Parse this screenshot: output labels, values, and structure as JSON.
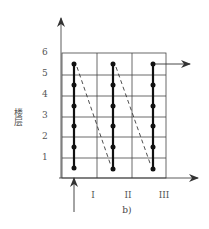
{
  "diagram": {
    "caption": "b)",
    "y_axis_label": "楼层",
    "y_ticks": [
      "1",
      "2",
      "3",
      "4",
      "5",
      "6"
    ],
    "x_sections": [
      "I",
      "II",
      "III"
    ],
    "grid": {
      "columns": 3,
      "rows": 6
    },
    "flow_columns": [
      {
        "section": "I",
        "floors_visited": 6,
        "direction": "up"
      },
      {
        "section": "II",
        "floors_visited": 6,
        "direction": "up"
      },
      {
        "section": "III",
        "floors_visited": 6,
        "direction": "up"
      }
    ],
    "transitions": [
      {
        "from": "I top",
        "to": "II bottom",
        "style": "dashed"
      },
      {
        "from": "II top",
        "to": "III bottom",
        "style": "dashed"
      }
    ],
    "entry_arrow": "bottom of section I",
    "exit_arrow": "top of section III, to the right",
    "colors": {
      "line": "#222222",
      "grid": "#333333",
      "text": "#555555"
    }
  }
}
